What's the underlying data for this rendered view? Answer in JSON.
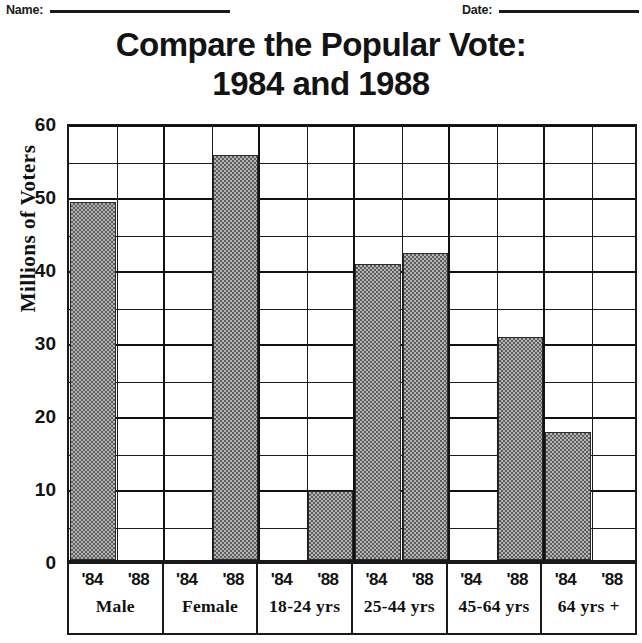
{
  "header": {
    "name_label": "Name:",
    "date_label": "Date:"
  },
  "title": {
    "line1": "Compare the Popular Vote:",
    "line2": "1984 and 1988"
  },
  "chart_data": {
    "type": "bar",
    "title": "Compare the Popular Vote: 1984 and 1988",
    "xlabel": "",
    "ylabel": "Millions of Voters",
    "ylim": [
      0,
      60
    ],
    "ytick_labels": [
      "0",
      "10",
      "20",
      "30",
      "40",
      "50",
      "60"
    ],
    "ytick_values": [
      0,
      10,
      20,
      30,
      40,
      50,
      60
    ],
    "minor_gridline_step": 5,
    "grid": true,
    "legend": "none",
    "categories": [
      "Male",
      "Female",
      "18-24 yrs",
      "25-44 yrs",
      "45-64 yrs",
      "64 yrs +"
    ],
    "series": [
      {
        "name": "'84",
        "values": [
          49,
          0,
          0,
          40.5,
          0,
          17.5
        ]
      },
      {
        "name": "'88",
        "values": [
          0,
          55.5,
          9.5,
          42,
          30.5,
          0
        ]
      }
    ],
    "bars": [
      {
        "group": "Male",
        "year": "'84",
        "value": 49
      },
      {
        "group": "Male",
        "year": "'88",
        "value": 0
      },
      {
        "group": "Female",
        "year": "'84",
        "value": 0
      },
      {
        "group": "Female",
        "year": "'88",
        "value": 55.5
      },
      {
        "group": "18-24 yrs",
        "year": "'84",
        "value": 0
      },
      {
        "group": "18-24 yrs",
        "year": "'88",
        "value": 9.5
      },
      {
        "group": "25-44 yrs",
        "year": "'84",
        "value": 40.5
      },
      {
        "group": "25-44 yrs",
        "year": "'88",
        "value": 42
      },
      {
        "group": "45-64 yrs",
        "year": "'84",
        "value": 0
      },
      {
        "group": "45-64 yrs",
        "year": "'88",
        "value": 30.5
      },
      {
        "group": "64 yrs +",
        "year": "'84",
        "value": 17.5
      },
      {
        "group": "64 yrs +",
        "year": "'88",
        "value": 0
      }
    ],
    "bar_color": "#8a8a8a",
    "axis_color": "#1a1a1a"
  }
}
